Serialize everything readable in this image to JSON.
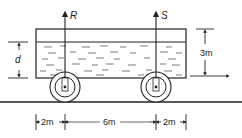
{
  "diagram": {
    "type": "tank-truck-hydrostatics",
    "colors": {
      "ink": "#222222",
      "background": "#ffffff"
    },
    "forces": [
      {
        "label": "R",
        "position": "front axle"
      },
      {
        "label": "S",
        "position": "rear axle"
      }
    ],
    "dimensions": {
      "depth_label": "d",
      "height_label": "3m",
      "spans": [
        {
          "label": "2m",
          "from": "tank-left-edge",
          "to": "axle-R"
        },
        {
          "label": "6m",
          "from": "axle-R",
          "to": "axle-S"
        },
        {
          "label": "2m",
          "from": "axle-S",
          "to": "tank-right-edge"
        }
      ]
    }
  }
}
